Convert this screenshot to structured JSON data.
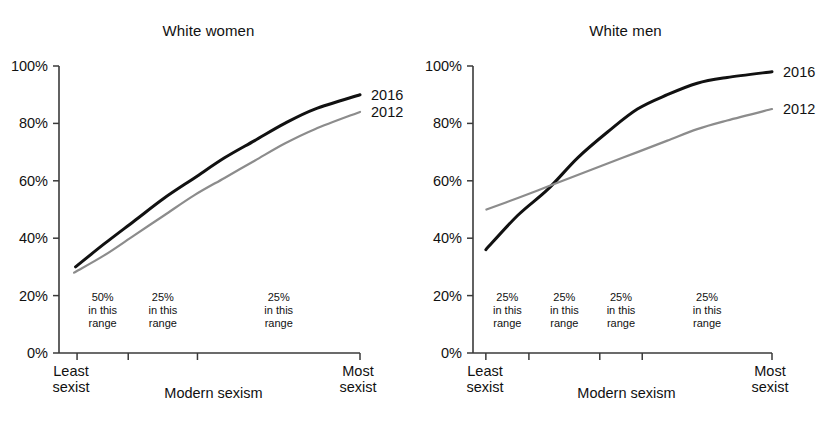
{
  "figure": {
    "background": "#ffffff",
    "panels": [
      {
        "id": "white-women",
        "title": "White women",
        "x_axis_title": "Modern sexism",
        "x_start_label_line1": "Least",
        "x_start_label_line2": "sexist",
        "x_end_label_line1": "Most",
        "x_end_label_line2": "sexist",
        "y_ticks": [
          "0%",
          "20%",
          "40%",
          "60%",
          "80%",
          "100%"
        ],
        "range_notes": [
          {
            "pct": "50%",
            "line2": "in this",
            "line3": "range"
          },
          {
            "pct": "25%",
            "line2": "in this",
            "line3": "range"
          },
          {
            "pct": "25%",
            "line2": "in this",
            "line3": "range"
          }
        ],
        "series_labels": [
          "2016",
          "2012"
        ]
      },
      {
        "id": "white-men",
        "title": "White men",
        "x_axis_title": "Modern sexism",
        "x_start_label_line1": "Least",
        "x_start_label_line2": "sexist",
        "x_end_label_line1": "Most",
        "x_end_label_line2": "sexist",
        "y_ticks": [
          "0%",
          "20%",
          "40%",
          "60%",
          "80%",
          "100%"
        ],
        "range_notes": [
          {
            "pct": "25%",
            "line2": "in this",
            "line3": "range"
          },
          {
            "pct": "25%",
            "line2": "in this",
            "line3": "range"
          },
          {
            "pct": "25%",
            "line2": "in this",
            "line3": "range"
          },
          {
            "pct": "25%",
            "line2": "in this",
            "line3": "range"
          }
        ],
        "series_labels": [
          "2016",
          "2012"
        ]
      }
    ]
  },
  "colors": {
    "series_2016": "#111111",
    "series_2012": "#8c8c8c",
    "axis": "#3a3a3a",
    "text": "#111111"
  },
  "chart_data": [
    {
      "type": "line",
      "title": "White women",
      "xlabel": "Modern sexism",
      "ylabel": "",
      "ylim": [
        0,
        100
      ],
      "y_tick_values": [
        0,
        20,
        40,
        60,
        80,
        100
      ],
      "y_tick_labels": [
        "0%",
        "20%",
        "40%",
        "60%",
        "80%",
        "100%"
      ],
      "xlim": [
        0,
        1
      ],
      "x_axis_start_label": "Least sexist",
      "x_axis_end_label": "Most sexist",
      "x_tick_fractions": [
        0.06,
        0.23,
        0.46
      ],
      "percentile_bands": [
        {
          "label": "50% in this range",
          "share": 50,
          "from_fraction": 0.06,
          "to_fraction": 0.23
        },
        {
          "label": "25% in this range",
          "share": 25,
          "from_fraction": 0.23,
          "to_fraction": 0.46
        },
        {
          "label": "25% in this range",
          "share": 25,
          "from_fraction": 0.46,
          "to_fraction": 1.0
        }
      ],
      "grid": false,
      "legend_position": "right-end-of-lines",
      "series": [
        {
          "name": "2016",
          "color": "#111111",
          "x": [
            0.055,
            0.15,
            0.25,
            0.35,
            0.45,
            0.55,
            0.65,
            0.75,
            0.85,
            1.0
          ],
          "values": [
            30,
            38,
            46,
            54,
            61,
            68,
            74,
            80,
            85,
            90
          ]
        },
        {
          "name": "2012",
          "color": "#8c8c8c",
          "x": [
            0.05,
            0.15,
            0.25,
            0.35,
            0.45,
            0.55,
            0.65,
            0.75,
            0.85,
            1.0
          ],
          "values": [
            28,
            34,
            41,
            48,
            55,
            61,
            67,
            73,
            78,
            84
          ]
        }
      ]
    },
    {
      "type": "line",
      "title": "White men",
      "xlabel": "Modern sexism",
      "ylabel": "",
      "ylim": [
        0,
        100
      ],
      "y_tick_values": [
        0,
        20,
        40,
        60,
        80,
        100
      ],
      "y_tick_labels": [
        "0%",
        "20%",
        "40%",
        "60%",
        "80%",
        "100%"
      ],
      "xlim": [
        0,
        1
      ],
      "x_axis_start_label": "Least sexist",
      "x_axis_end_label": "Most sexist",
      "x_tick_fractions": [
        0.043,
        0.187,
        0.424,
        0.566
      ],
      "percentile_bands": [
        {
          "label": "25% in this range",
          "share": 25,
          "from_fraction": 0.043,
          "to_fraction": 0.187
        },
        {
          "label": "25% in this range",
          "share": 25,
          "from_fraction": 0.187,
          "to_fraction": 0.424
        },
        {
          "label": "25% in this range",
          "share": 25,
          "from_fraction": 0.424,
          "to_fraction": 0.566
        },
        {
          "label": "25% in this range",
          "share": 25,
          "from_fraction": 0.566,
          "to_fraction": 1.0
        }
      ],
      "grid": false,
      "legend_position": "right-end-of-lines",
      "crossover": {
        "x_fraction": 0.247,
        "value": 56
      },
      "series": [
        {
          "name": "2016",
          "color": "#111111",
          "x": [
            0.043,
            0.15,
            0.25,
            0.35,
            0.45,
            0.55,
            0.65,
            0.75,
            0.85,
            1.0
          ],
          "values": [
            36,
            48,
            57,
            68,
            77,
            85,
            90,
            94,
            96,
            98
          ]
        },
        {
          "name": "2012",
          "color": "#8c8c8c",
          "x": [
            0.045,
            0.15,
            0.25,
            0.35,
            0.45,
            0.55,
            0.65,
            0.75,
            0.85,
            1.0
          ],
          "values": [
            50,
            54,
            58,
            62,
            66,
            70,
            74,
            78,
            81,
            85
          ]
        }
      ]
    }
  ]
}
